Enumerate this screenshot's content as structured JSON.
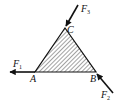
{
  "diagram": {
    "type": "statics-force-diagram",
    "body": {
      "shape": "triangle",
      "fill": "hatched",
      "vertices": [
        "A",
        "B",
        "C"
      ]
    },
    "points": {
      "A": {
        "label": "A"
      },
      "B": {
        "label": "B"
      },
      "C": {
        "label": "C"
      }
    },
    "forces": [
      {
        "name": "F",
        "sub": "1",
        "applied_at": "A",
        "direction": "left"
      },
      {
        "name": "F",
        "sub": "2",
        "applied_at": "B",
        "direction": "up-left (toward B)"
      },
      {
        "name": "F",
        "sub": "3",
        "applied_at": "C",
        "direction": "down-left (toward C)"
      }
    ],
    "colors": {
      "stroke": "#111111",
      "hatch": "#333333",
      "background": "#ffffff"
    }
  }
}
